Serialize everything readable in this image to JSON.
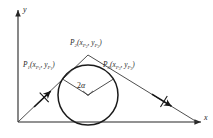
{
  "figure": {
    "background": "#ffffff",
    "stroke_color": "#262626",
    "width": 213,
    "height": 138
  },
  "axes": {
    "x_label": "x",
    "y_label": "y",
    "origin": {
      "x": 18,
      "y": 122
    },
    "x_axis": {
      "x1": 18,
      "y1": 122,
      "x2": 203,
      "y2": 122
    },
    "y_axis": {
      "x1": 18,
      "y1": 122,
      "x2": 18,
      "y2": 8
    }
  },
  "circle": {
    "center": {
      "x": 88,
      "y": 95
    },
    "radius": 30,
    "label": "inscribed-circle"
  },
  "points": [
    {
      "id": "P1",
      "name": "point-p1",
      "base": "P",
      "base_sub": "1",
      "coord_text": "(x",
      "coord_sub1": "P",
      "coord_subsub1": "1",
      "coord_mid": ", y",
      "coord_sub2": "P",
      "coord_subsub2": "1",
      "coord_close": ")",
      "label_x": 23,
      "label_y": 66,
      "marker": {
        "x": 62,
        "y": 79
      }
    },
    {
      "id": "P2",
      "name": "point-p2",
      "base": "P",
      "base_sub": "2",
      "coord_text": "(x",
      "coord_sub1": "P",
      "coord_subsub1": "2",
      "coord_mid": ", y",
      "coord_sub2": "P",
      "coord_subsub2": "2",
      "coord_close": ")",
      "label_x": 70,
      "label_y": 45,
      "marker": {
        "x": 88,
        "y": 55
      }
    },
    {
      "id": "P3",
      "name": "point-p3",
      "base": "P",
      "base_sub": "3",
      "coord_text": "(x",
      "coord_sub1": "P",
      "coord_subsub1": "3",
      "coord_mid": ", y",
      "coord_sub2": "P",
      "coord_subsub2": "3",
      "coord_close": ")",
      "label_x": 103,
      "label_y": 66,
      "marker": {
        "x": 113,
        "y": 79
      }
    }
  ],
  "angle": {
    "label_number": "2",
    "label_greek": "α",
    "label_x": 79,
    "label_y": 87,
    "vertex": {
      "x": 88,
      "y": 95
    },
    "right_angle_marker": true
  },
  "rays": {
    "left_ray": {
      "x1": 18,
      "y1": 122,
      "x2": 88,
      "y2": 55
    },
    "right_ray": {
      "x1": 88,
      "y1": 55,
      "x2": 196,
      "y2": 122
    },
    "left_arrow_at": {
      "x": 44,
      "y": 97
    },
    "right_arrow_at": {
      "x": 163,
      "y": 101
    }
  },
  "radii": [
    {
      "name": "radius-to-p1",
      "x1": 88,
      "y1": 95,
      "x2": 62,
      "y2": 79
    },
    {
      "name": "radius-to-p3",
      "x1": 88,
      "y1": 95,
      "x2": 113,
      "y2": 79
    }
  ]
}
